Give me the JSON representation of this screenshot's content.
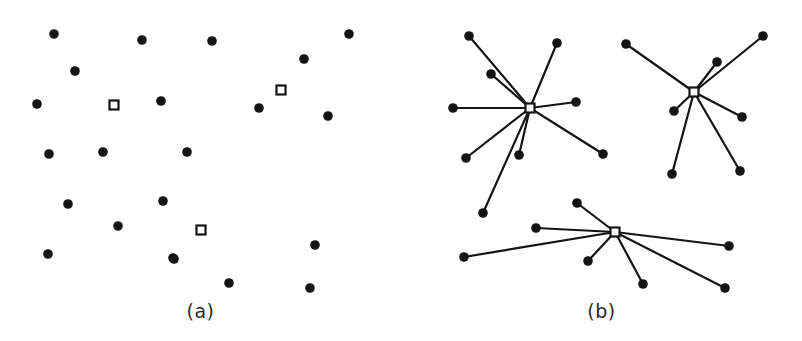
{
  "figure": {
    "width": 802,
    "height": 341,
    "background_color": "#ffffff",
    "data_point_color": "#141414",
    "center_marker_fill": "#ffffff",
    "center_marker_stroke": "#141414",
    "edge_color": "#141414",
    "data_point_radius": 4.8,
    "center_marker_size": 9,
    "edge_width": 2.2
  },
  "panels": [
    {
      "id": "a",
      "caption": "(a)",
      "description": "unclustered scatter of data points with three cluster-center markers",
      "origin_x": 0,
      "width": 401,
      "points": [
        {
          "x": 54,
          "y": 34
        },
        {
          "x": 142,
          "y": 40
        },
        {
          "x": 212,
          "y": 41
        },
        {
          "x": 349,
          "y": 34
        },
        {
          "x": 304,
          "y": 59
        },
        {
          "x": 75,
          "y": 71
        },
        {
          "x": 37,
          "y": 104
        },
        {
          "x": 161,
          "y": 101
        },
        {
          "x": 259,
          "y": 108
        },
        {
          "x": 328,
          "y": 116
        },
        {
          "x": 49,
          "y": 154
        },
        {
          "x": 103,
          "y": 152
        },
        {
          "x": 187,
          "y": 152
        },
        {
          "x": 68,
          "y": 204
        },
        {
          "x": 163,
          "y": 201
        },
        {
          "x": 315,
          "y": 245
        },
        {
          "x": 118,
          "y": 226
        },
        {
          "x": 174,
          "y": 259
        },
        {
          "x": 48,
          "y": 254
        },
        {
          "x": 173,
          "y": 258
        },
        {
          "x": 229,
          "y": 283
        },
        {
          "x": 310,
          "y": 288
        }
      ],
      "centers": [
        {
          "x": 114,
          "y": 105
        },
        {
          "x": 281,
          "y": 90
        },
        {
          "x": 201,
          "y": 230
        }
      ]
    },
    {
      "id": "b",
      "caption": "(b)",
      "description": "three clusters drawn as stars linking each data point to its assigned cluster center",
      "origin_x": 401,
      "width": 401,
      "clusters": [
        {
          "name": "cluster-1",
          "center": {
            "x": 129,
            "y": 108
          },
          "members": [
            {
              "x": 68,
              "y": 36
            },
            {
              "x": 156,
              "y": 43
            },
            {
              "x": 90,
              "y": 74
            },
            {
              "x": 52,
              "y": 108
            },
            {
              "x": 175,
              "y": 102
            },
            {
              "x": 65,
              "y": 158
            },
            {
              "x": 118,
              "y": 155
            },
            {
              "x": 202,
              "y": 154
            },
            {
              "x": 82,
              "y": 213
            }
          ]
        },
        {
          "name": "cluster-2",
          "center": {
            "x": 293,
            "y": 92
          },
          "members": [
            {
              "x": 225,
              "y": 44
            },
            {
              "x": 362,
              "y": 36
            },
            {
              "x": 316,
              "y": 62
            },
            {
              "x": 273,
              "y": 111
            },
            {
              "x": 341,
              "y": 117
            },
            {
              "x": 271,
              "y": 174
            },
            {
              "x": 339,
              "y": 171
            }
          ]
        },
        {
          "name": "cluster-3",
          "center": {
            "x": 214,
            "y": 232
          },
          "members": [
            {
              "x": 176,
              "y": 203
            },
            {
              "x": 135,
              "y": 228
            },
            {
              "x": 63,
              "y": 257
            },
            {
              "x": 187,
              "y": 261
            },
            {
              "x": 242,
              "y": 284
            },
            {
              "x": 328,
              "y": 246
            },
            {
              "x": 324,
              "y": 288
            }
          ]
        }
      ]
    }
  ]
}
